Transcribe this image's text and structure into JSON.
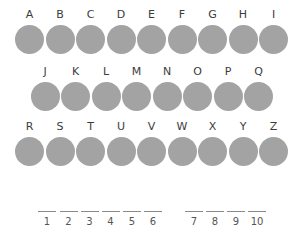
{
  "colors": {
    "disc": "#a3a3a3",
    "label": "#3c3c3c",
    "blank_line": "#8a8a8a",
    "background": "#ffffff"
  },
  "rows": [
    {
      "letters": [
        "A",
        "B",
        "C",
        "D",
        "E",
        "F",
        "G",
        "H",
        "I"
      ]
    },
    {
      "letters": [
        "J",
        "K",
        "L",
        "M",
        "N",
        "O",
        "P",
        "Q"
      ]
    },
    {
      "letters": [
        "R",
        "S",
        "T",
        "U",
        "V",
        "W",
        "X",
        "Y",
        "Z"
      ]
    }
  ],
  "answer": {
    "word1": [
      "1",
      "2",
      "3",
      "4",
      "5",
      "6"
    ],
    "word2": [
      "7",
      "8",
      "9",
      "10"
    ]
  }
}
